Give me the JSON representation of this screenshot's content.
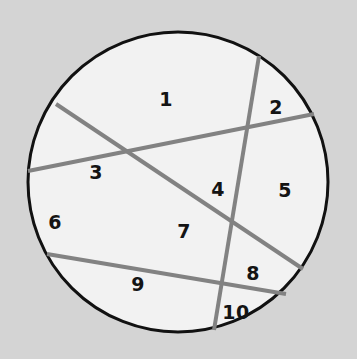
{
  "figure": {
    "background_color": "#d4d4d4",
    "circle": {
      "fill_color": "#f2f2f2",
      "stroke_color": "#111111",
      "stroke_width": 3,
      "center_x": 178,
      "center_y": 182,
      "radius": 150
    },
    "chords": {
      "stroke_color": "#828282",
      "stroke_width": 4,
      "items": [
        {
          "name": "chord-upper-left-to-lower-right",
          "x1": 56,
          "y1": 104,
          "x2": 303,
          "y2": 269
        },
        {
          "name": "chord-left-to-upper-right",
          "x1": 28,
          "y1": 171,
          "x2": 314,
          "y2": 114
        },
        {
          "name": "chord-lower-left-to-upper-right",
          "x1": 47,
          "y1": 254,
          "x2": 286,
          "y2": 294
        },
        {
          "name": "chord-near-vertical",
          "x1": 259,
          "y1": 56,
          "x2": 214,
          "y2": 330
        }
      ]
    },
    "region_labels": [
      {
        "name": "region-label-1",
        "text": "1",
        "x": 166,
        "y": 100
      },
      {
        "name": "region-label-2",
        "text": "2",
        "x": 276,
        "y": 108
      },
      {
        "name": "region-label-3",
        "text": "3",
        "x": 96,
        "y": 173
      },
      {
        "name": "region-label-4",
        "text": "4",
        "x": 218,
        "y": 190
      },
      {
        "name": "region-label-5",
        "text": "5",
        "x": 285,
        "y": 191
      },
      {
        "name": "region-label-6",
        "text": "6",
        "x": 55,
        "y": 223
      },
      {
        "name": "region-label-7",
        "text": "7",
        "x": 184,
        "y": 232
      },
      {
        "name": "region-label-8",
        "text": "8",
        "x": 253,
        "y": 274
      },
      {
        "name": "region-label-9",
        "text": "9",
        "x": 138,
        "y": 285
      },
      {
        "name": "region-label-10",
        "text": "10",
        "x": 236,
        "y": 313
      }
    ]
  }
}
